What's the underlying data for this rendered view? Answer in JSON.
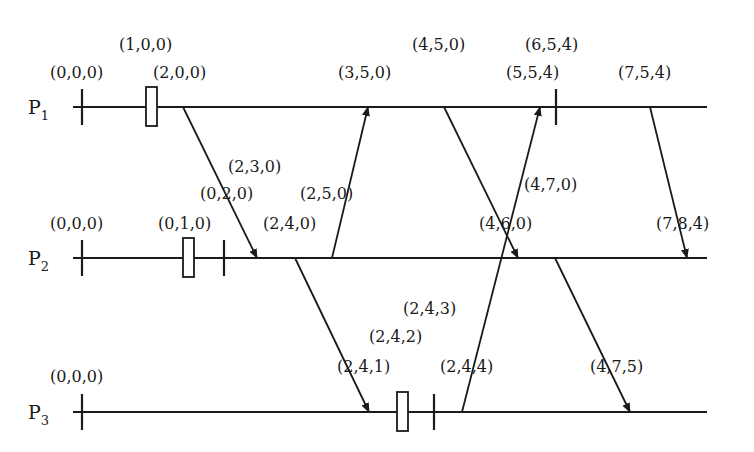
{
  "processes": [
    {
      "name": "P",
      "sub": "1",
      "y": 107,
      "x_start": 73,
      "x_end": 707
    },
    {
      "name": "P",
      "sub": "2",
      "y": 258,
      "x_start": 73,
      "x_end": 707
    },
    {
      "name": "P",
      "sub": "3",
      "y": 412,
      "x_start": 73,
      "x_end": 707
    }
  ],
  "ticks": [
    {
      "process": 0,
      "x": 82
    },
    {
      "process": 0,
      "x": 556
    },
    {
      "process": 1,
      "x": 82
    },
    {
      "process": 1,
      "x": 224
    },
    {
      "process": 2,
      "x": 82
    },
    {
      "process": 2,
      "x": 434
    }
  ],
  "local_event_boxes": [
    {
      "process": 0,
      "x": 146
    },
    {
      "process": 1,
      "x": 183
    },
    {
      "process": 2,
      "x": 397
    }
  ],
  "messages": [
    {
      "from": 0,
      "from_x": 183,
      "to": 1,
      "to_x": 257
    },
    {
      "from": 1,
      "from_x": 332,
      "to": 0,
      "to_x": 368
    },
    {
      "from": 1,
      "from_x": 295,
      "to": 2,
      "to_x": 369
    },
    {
      "from": 0,
      "from_x": 444,
      "to": 1,
      "to_x": 518
    },
    {
      "from": 2,
      "from_x": 462,
      "to": 0,
      "to_x": 540
    },
    {
      "from": 1,
      "from_x": 555,
      "to": 2,
      "to_x": 630
    },
    {
      "from": 0,
      "from_x": 650,
      "to": 1,
      "to_x": 687
    }
  ],
  "labels": [
    {
      "text": "(1,0,0)",
      "x": 119,
      "y": 50
    },
    {
      "text": "(0,0,0)",
      "x": 50,
      "y": 78
    },
    {
      "text": "(2,0,0)",
      "x": 153,
      "y": 78
    },
    {
      "text": "(3,5,0)",
      "x": 338,
      "y": 78
    },
    {
      "text": "(4,5,0)",
      "x": 412,
      "y": 50
    },
    {
      "text": "(6,5,4)",
      "x": 525,
      "y": 50
    },
    {
      "text": "(5,5,4)",
      "x": 506,
      "y": 78
    },
    {
      "text": "(7,5,4)",
      "x": 618,
      "y": 78
    },
    {
      "text": "(2,3,0)",
      "x": 228,
      "y": 172
    },
    {
      "text": "(0,2,0)",
      "x": 200,
      "y": 199
    },
    {
      "text": "(2,5,0)",
      "x": 300,
      "y": 199
    },
    {
      "text": "(4,7,0)",
      "x": 524,
      "y": 190
    },
    {
      "text": "(0,0,0)",
      "x": 50,
      "y": 229
    },
    {
      "text": "(0,1,0)",
      "x": 158,
      "y": 229
    },
    {
      "text": "(2,4,0)",
      "x": 263,
      "y": 229
    },
    {
      "text": "(4,6,0)",
      "x": 479,
      "y": 229
    },
    {
      "text": "(7,8,4)",
      "x": 656,
      "y": 229
    },
    {
      "text": "(2,4,3)",
      "x": 403,
      "y": 314
    },
    {
      "text": "(2,4,2)",
      "x": 369,
      "y": 342
    },
    {
      "text": "(0,0,0)",
      "x": 50,
      "y": 382
    },
    {
      "text": "(2,4,1)",
      "x": 337,
      "y": 372
    },
    {
      "text": "(2,4,4)",
      "x": 440,
      "y": 372
    },
    {
      "text": "(4,7,5)",
      "x": 590,
      "y": 372
    }
  ]
}
